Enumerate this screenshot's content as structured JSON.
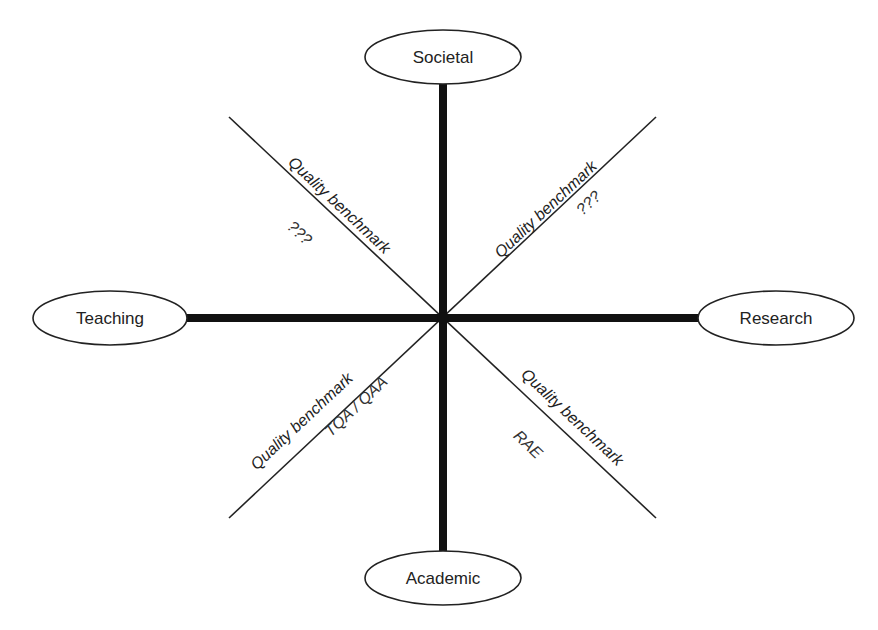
{
  "diagram": {
    "type": "quality-dimensions-cross",
    "center": {
      "x": 443,
      "y": 318
    },
    "colors": {
      "line": "#111111",
      "ellipse_stroke": "#222222",
      "text": "#222222",
      "background": "#ffffff"
    },
    "nodes": {
      "top": {
        "label": "Societal"
      },
      "left": {
        "label": "Teaching"
      },
      "right": {
        "label": "Research"
      },
      "bottom": {
        "label": "Academic"
      }
    },
    "benchmarks": {
      "top_left": {
        "label": "Quality benchmark",
        "value": "???"
      },
      "top_right": {
        "label": "Quality benchmark",
        "value": "???"
      },
      "bottom_left": {
        "label": "Quality benchmark",
        "value": "TQA / QAA"
      },
      "bottom_right": {
        "label": "Quality benchmark",
        "value": "RAE"
      }
    }
  }
}
